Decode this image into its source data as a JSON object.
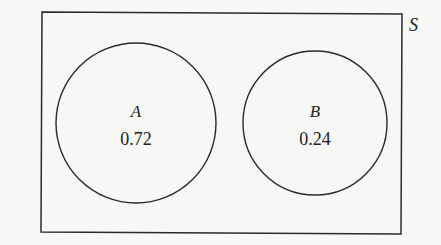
{
  "diagram": {
    "type": "venn",
    "sample_space_label": "S",
    "sets": [
      {
        "label": "A",
        "probability": "0.72"
      },
      {
        "label": "B",
        "probability": "0.24"
      }
    ],
    "overlap": "none"
  }
}
